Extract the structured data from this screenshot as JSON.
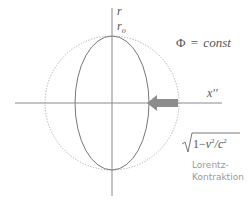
{
  "diagram": {
    "axis_vertical_label": "r",
    "radius_label": "r",
    "radius_label_subscript": "o",
    "axis_horizontal_label": "x''",
    "phase_label_symbol": "Φ",
    "phase_label_eq": "=",
    "phase_label_value": "const",
    "formula": {
      "sqrt_prefix": "1−",
      "v": "v",
      "slash": "/",
      "c": "c",
      "exp": "2"
    },
    "caption_line1": "Lorentz-",
    "caption_line2": "Kontraktion",
    "colors": {
      "axis": "#8a8a8a",
      "ellipse": "#777777",
      "circle_dotted": "#aaaaaa",
      "arrow": "#8c8c8c",
      "caption": "#9a9a9a"
    },
    "shapes": {
      "center": [
        112,
        103
      ],
      "circle_radius": 67,
      "ellipse_rx": 37,
      "ellipse_ry": 67
    },
    "arrow_direction": "left"
  }
}
